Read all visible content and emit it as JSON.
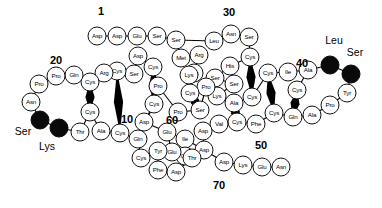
{
  "figure": {
    "type": "protein-sequence-diagram",
    "bead_fill": "#ffffff",
    "bead_stroke": "#111111",
    "highlight_fill": "#0a0a0a",
    "bond_color": "#000000"
  },
  "position_labels": [
    {
      "text": "1",
      "x": 101,
      "y": 11
    },
    {
      "text": "20",
      "x": 56,
      "y": 60
    },
    {
      "text": "30",
      "x": 229,
      "y": 12
    },
    {
      "text": "40",
      "x": 302,
      "y": 63
    },
    {
      "text": "10",
      "x": 127,
      "y": 119
    },
    {
      "text": "60",
      "x": 172,
      "y": 120
    },
    {
      "text": "50",
      "x": 261,
      "y": 145
    },
    {
      "text": "70",
      "x": 219,
      "y": 185
    }
  ],
  "terminal_labels": [
    {
      "text": "Leu",
      "x": 334,
      "y": 40
    },
    {
      "text": "Ser",
      "x": 355,
      "y": 52
    },
    {
      "text": "Ser",
      "x": 23,
      "y": 131
    },
    {
      "text": "Lys",
      "x": 47,
      "y": 146
    }
  ],
  "residues": [
    {
      "label": "Asp",
      "x": 97,
      "y": 36,
      "dark": false
    },
    {
      "label": "Asp",
      "x": 117,
      "y": 36,
      "dark": false
    },
    {
      "label": "Glu",
      "x": 137,
      "y": 36,
      "dark": false
    },
    {
      "label": "Ser",
      "x": 157,
      "y": 36,
      "dark": false
    },
    {
      "label": "Ser",
      "x": 176,
      "y": 40,
      "dark": false
    },
    {
      "label": "Met",
      "x": 181,
      "y": 58,
      "dark": false
    },
    {
      "label": "Arg",
      "x": 199,
      "y": 55,
      "dark": false
    },
    {
      "label": "Lys",
      "x": 194,
      "y": 73,
      "dark": false
    },
    {
      "label": "Leu",
      "x": 214,
      "y": 41,
      "dark": false
    },
    {
      "label": "Asn",
      "x": 231,
      "y": 34,
      "dark": false
    },
    {
      "label": "Ser",
      "x": 249,
      "y": 37,
      "dark": false
    },
    {
      "label": "Cys",
      "x": 250,
      "y": 57,
      "dark": false
    },
    {
      "label": "His",
      "x": 230,
      "y": 66,
      "dark": false
    },
    {
      "label": "Ser",
      "x": 215,
      "y": 78,
      "dark": false
    },
    {
      "label": "Ser",
      "x": 234,
      "y": 84,
      "dark": false
    },
    {
      "label": "Lys",
      "x": 217,
      "y": 96,
      "dark": false
    },
    {
      "label": "Ala",
      "x": 234,
      "y": 103,
      "dark": false
    },
    {
      "label": "Cys",
      "x": 252,
      "y": 97,
      "dark": false
    },
    {
      "label": "Cys",
      "x": 268,
      "y": 73,
      "dark": false
    },
    {
      "label": "Ile",
      "x": 288,
      "y": 72,
      "dark": false
    },
    {
      "label": "Ala",
      "x": 308,
      "y": 70,
      "dark": false
    },
    {
      "label": "Cys",
      "x": 297,
      "y": 90,
      "dark": false
    },
    {
      "label": "Leu",
      "x": 330,
      "y": 65,
      "dark": true
    },
    {
      "label": "Ser",
      "x": 351,
      "y": 74,
      "dark": true
    },
    {
      "label": "Tyr",
      "x": 347,
      "y": 93,
      "dark": false
    },
    {
      "label": "Pro",
      "x": 330,
      "y": 105,
      "dark": false
    },
    {
      "label": "Ala",
      "x": 312,
      "y": 115,
      "dark": false
    },
    {
      "label": "Gln",
      "x": 293,
      "y": 117,
      "dark": false
    },
    {
      "label": "Cys",
      "x": 274,
      "y": 113,
      "dark": false
    },
    {
      "label": "Phe",
      "x": 256,
      "y": 124,
      "dark": false
    },
    {
      "label": "Cys",
      "x": 237,
      "y": 122,
      "dark": false
    },
    {
      "label": "Val",
      "x": 219,
      "y": 124,
      "dark": false
    },
    {
      "label": "Asp",
      "x": 203,
      "y": 131,
      "dark": false
    },
    {
      "label": "Asp",
      "x": 204,
      "y": 150,
      "dark": false
    },
    {
      "label": "Ile",
      "x": 185,
      "y": 139,
      "dark": false
    },
    {
      "label": "Glu",
      "x": 185,
      "y": 156,
      "dark": false
    },
    {
      "label": "Asp",
      "x": 224,
      "y": 162,
      "dark": false
    },
    {
      "label": "Lys",
      "x": 243,
      "y": 165,
      "dark": false
    },
    {
      "label": "Glu",
      "x": 262,
      "y": 167,
      "dark": false
    },
    {
      "label": "Asn",
      "x": 281,
      "y": 167,
      "dark": false
    },
    {
      "label": "Glu",
      "x": 167,
      "y": 132,
      "dark": false
    },
    {
      "label": "Glu",
      "x": 172,
      "y": 152,
      "dark": false
    },
    {
      "label": "Thr",
      "x": 192,
      "y": 158,
      "dark": false
    },
    {
      "label": "Pro",
      "x": 178,
      "y": 112,
      "dark": false
    },
    {
      "label": "Ser",
      "x": 200,
      "y": 110,
      "dark": false
    },
    {
      "label": "Pro",
      "x": 206,
      "y": 87,
      "dark": false
    },
    {
      "label": "Cys",
      "x": 190,
      "y": 93,
      "dark": false
    },
    {
      "label": "Lys",
      "x": 189,
      "y": 75,
      "dark": false
    },
    {
      "label": "Cys",
      "x": 154,
      "y": 104,
      "dark": false
    },
    {
      "label": "Asp",
      "x": 144,
      "y": 122,
      "dark": false
    },
    {
      "label": "Pro",
      "x": 158,
      "y": 86,
      "dark": false
    },
    {
      "label": "Cys",
      "x": 153,
      "y": 67,
      "dark": false
    },
    {
      "label": "Asp",
      "x": 138,
      "y": 56,
      "dark": false
    },
    {
      "label": "Ser",
      "x": 134,
      "y": 74,
      "dark": false
    },
    {
      "label": "Cys",
      "x": 117,
      "y": 71,
      "dark": false
    },
    {
      "label": "Arg",
      "x": 104,
      "y": 73,
      "dark": false
    },
    {
      "label": "Cys",
      "x": 90,
      "y": 82,
      "dark": false
    },
    {
      "label": "Gln",
      "x": 74,
      "y": 75,
      "dark": false
    },
    {
      "label": "Pro",
      "x": 56,
      "y": 76,
      "dark": false
    },
    {
      "label": "Pro",
      "x": 39,
      "y": 84,
      "dark": false
    },
    {
      "label": "Asn",
      "x": 31,
      "y": 102,
      "dark": false
    },
    {
      "label": "Ser",
      "x": 40,
      "y": 120,
      "dark": true
    },
    {
      "label": "Lys",
      "x": 59,
      "y": 128,
      "dark": true
    },
    {
      "label": "Thr",
      "x": 80,
      "y": 132,
      "dark": false
    },
    {
      "label": "Cys",
      "x": 90,
      "y": 112,
      "dark": false
    },
    {
      "label": "Ala",
      "x": 101,
      "y": 131,
      "dark": false
    },
    {
      "label": "Cys",
      "x": 120,
      "y": 133,
      "dark": false
    },
    {
      "label": "Gln",
      "x": 138,
      "y": 139,
      "dark": false
    },
    {
      "label": "Cys",
      "x": 141,
      "y": 158,
      "dark": false
    },
    {
      "label": "Tyr",
      "x": 158,
      "y": 151,
      "dark": false
    },
    {
      "label": "Phe",
      "x": 158,
      "y": 170,
      "dark": false
    },
    {
      "label": "Asp",
      "x": 176,
      "y": 172,
      "dark": false
    }
  ],
  "backbone_links": [
    [
      97,
      36,
      117,
      36
    ],
    [
      117,
      36,
      137,
      36
    ],
    [
      137,
      36,
      157,
      36
    ],
    [
      157,
      36,
      176,
      40
    ],
    [
      176,
      40,
      181,
      58
    ],
    [
      181,
      58,
      199,
      55
    ],
    [
      199,
      55,
      194,
      73
    ],
    [
      176,
      40,
      214,
      41
    ],
    [
      214,
      41,
      231,
      34
    ],
    [
      231,
      34,
      249,
      37
    ],
    [
      249,
      37,
      250,
      57
    ],
    [
      250,
      57,
      230,
      66
    ],
    [
      230,
      66,
      215,
      78
    ],
    [
      215,
      78,
      234,
      84
    ],
    [
      234,
      84,
      217,
      96
    ],
    [
      217,
      96,
      234,
      103
    ],
    [
      234,
      103,
      252,
      97
    ],
    [
      252,
      97,
      268,
      73
    ],
    [
      268,
      73,
      288,
      72
    ],
    [
      288,
      72,
      308,
      70
    ],
    [
      308,
      70,
      297,
      90
    ],
    [
      308,
      70,
      330,
      65
    ],
    [
      330,
      65,
      351,
      74
    ],
    [
      351,
      74,
      347,
      93
    ],
    [
      347,
      93,
      330,
      105
    ],
    [
      330,
      105,
      312,
      115
    ],
    [
      312,
      115,
      293,
      117
    ],
    [
      293,
      117,
      274,
      113
    ],
    [
      274,
      113,
      256,
      124
    ],
    [
      256,
      124,
      237,
      122
    ],
    [
      237,
      122,
      219,
      124
    ],
    [
      219,
      124,
      203,
      131
    ],
    [
      203,
      131,
      204,
      150
    ],
    [
      204,
      150,
      185,
      139
    ],
    [
      185,
      139,
      185,
      156
    ],
    [
      204,
      150,
      224,
      162
    ],
    [
      224,
      162,
      243,
      165
    ],
    [
      243,
      165,
      262,
      167
    ],
    [
      262,
      167,
      281,
      167
    ],
    [
      167,
      132,
      185,
      139
    ],
    [
      167,
      132,
      172,
      152
    ],
    [
      172,
      152,
      192,
      158
    ],
    [
      178,
      112,
      200,
      110
    ],
    [
      200,
      110,
      206,
      87
    ],
    [
      206,
      87,
      190,
      93
    ],
    [
      190,
      93,
      189,
      75
    ],
    [
      154,
      104,
      144,
      122
    ],
    [
      158,
      86,
      178,
      112
    ],
    [
      153,
      67,
      158,
      86
    ],
    [
      138,
      56,
      153,
      67
    ],
    [
      134,
      74,
      138,
      56
    ],
    [
      117,
      71,
      134,
      74
    ],
    [
      104,
      73,
      117,
      71
    ],
    [
      90,
      82,
      104,
      73
    ],
    [
      74,
      75,
      90,
      82
    ],
    [
      56,
      76,
      74,
      75
    ],
    [
      39,
      84,
      56,
      76
    ],
    [
      31,
      102,
      39,
      84
    ],
    [
      40,
      120,
      31,
      102
    ],
    [
      59,
      128,
      40,
      120
    ],
    [
      80,
      132,
      59,
      128
    ],
    [
      90,
      112,
      80,
      132
    ],
    [
      101,
      131,
      90,
      112
    ],
    [
      120,
      133,
      101,
      131
    ],
    [
      138,
      139,
      120,
      133
    ],
    [
      141,
      158,
      138,
      139
    ],
    [
      158,
      151,
      141,
      158
    ],
    [
      158,
      170,
      158,
      151
    ],
    [
      176,
      172,
      158,
      170
    ],
    [
      176,
      172,
      192,
      158
    ],
    [
      144,
      122,
      167,
      132
    ],
    [
      154,
      104,
      138,
      139
    ]
  ],
  "disulfide_bonds": [
    [
      117,
      71,
      120,
      133
    ],
    [
      153,
      67,
      154,
      104
    ],
    [
      250,
      57,
      252,
      97
    ],
    [
      268,
      73,
      274,
      113
    ],
    [
      297,
      90,
      293,
      117
    ],
    [
      237,
      122,
      234,
      103
    ],
    [
      90,
      82,
      90,
      112
    ],
    [
      190,
      93,
      200,
      110
    ]
  ]
}
